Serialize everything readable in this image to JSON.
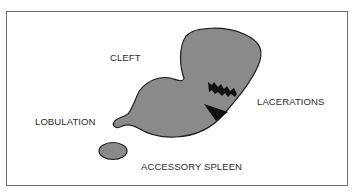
{
  "diagram": {
    "labels": {
      "cleft": "CLEFT",
      "lacerations": "LACERATIONS",
      "lobulation": "LOBULATION",
      "accessory_spleen": "ACCESSORY SPLEEN"
    },
    "colors": {
      "organ_fill": "#8a8a8a",
      "organ_stroke": "#1e1e1e",
      "laceration": "#111111",
      "border": "#6e6e6e",
      "text": "#2a2a2a"
    }
  }
}
